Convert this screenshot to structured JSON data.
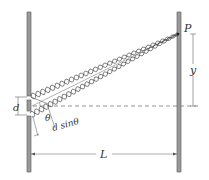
{
  "diagram": {
    "labels": {
      "point": "P",
      "screen_offset": "y",
      "slit_separation": "d",
      "angle": "θ",
      "path_difference": "d sinθ",
      "distance": "L"
    },
    "colors": {
      "barrier_fill": "#9a9a9a",
      "barrier_stroke": "#555555",
      "wave_stroke": "#444444",
      "dim_line": "#666666",
      "text": "#333333"
    }
  }
}
